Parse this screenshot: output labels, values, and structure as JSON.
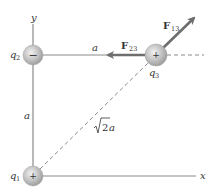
{
  "diagram": {
    "axes": {
      "x_label": "x",
      "y_label": "y"
    },
    "charges": [
      {
        "id": "q1",
        "label": "q",
        "subscript": "1",
        "sign": "+"
      },
      {
        "id": "q2",
        "label": "q",
        "subscript": "2",
        "sign": "−"
      },
      {
        "id": "q3",
        "label": "q",
        "subscript": "3",
        "sign": "+"
      }
    ],
    "forces": [
      {
        "id": "F13",
        "label": "F",
        "subscript": "13"
      },
      {
        "id": "F23",
        "label": "F",
        "subscript": "23"
      }
    ],
    "distances": {
      "horizontal": "a",
      "vertical": "a",
      "diagonal_root": "2",
      "diagonal_var": "a"
    },
    "colors": {
      "axis": "#8a8a8a",
      "force_arrow": "#6e6e6e",
      "dashed": "#8a8a8a",
      "charge_fill": "#b8b8b8",
      "text": "#333333"
    }
  }
}
